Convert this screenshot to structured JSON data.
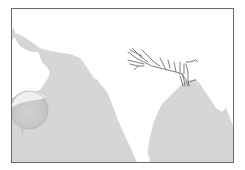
{
  "map": {
    "subject": "Indian subcontinent with Ganges river system",
    "colors": {
      "land": "#ffffff",
      "sea": "#d6d6d6",
      "river": "#6e6e6e",
      "frame": "#6a6a6a",
      "stain": "#c9c9c9"
    },
    "features": [
      {
        "name": "Arabian Sea",
        "type": "sea",
        "label_visible": false
      },
      {
        "name": "Bay of Bengal",
        "type": "sea",
        "label_visible": false
      },
      {
        "name": "Indian subcontinent",
        "type": "land",
        "label_visible": false
      },
      {
        "name": "Arabian Peninsula",
        "type": "land",
        "label_visible": false
      },
      {
        "name": "Ganges river system",
        "type": "river",
        "label_visible": false
      },
      {
        "name": "circular stain",
        "type": "marker",
        "label_visible": false
      }
    ]
  }
}
